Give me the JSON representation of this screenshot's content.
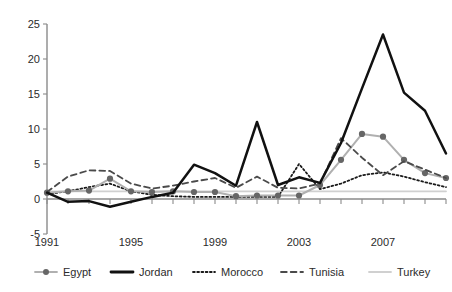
{
  "chart_data": {
    "type": "line",
    "title": "",
    "xlabel": "",
    "ylabel": "",
    "xlim": [
      1991,
      2010
    ],
    "ylim": [
      -5,
      25
    ],
    "grid": false,
    "legend_position": "bottom",
    "x": [
      1991,
      1992,
      1993,
      1994,
      1995,
      1996,
      1997,
      1998,
      1999,
      2000,
      2001,
      2002,
      2003,
      2004,
      2005,
      2006,
      2007,
      2008,
      2009,
      2010
    ],
    "xticks": [
      1991,
      1995,
      1999,
      2003,
      2007
    ],
    "xtick_labels": [
      "1991",
      "1995",
      "1999",
      "2003",
      "2007"
    ],
    "yticks": [
      -5,
      0,
      5,
      10,
      15,
      20,
      25
    ],
    "ytick_labels": [
      "-5",
      "0",
      "5",
      "10",
      "15",
      "20",
      "25"
    ],
    "series": [
      {
        "name": "Egypt",
        "color": "#b0b0b0",
        "marker": "circle",
        "marker_color": "#666666",
        "style": "solid",
        "values": [
          0.9,
          1.1,
          1.2,
          2.9,
          1.1,
          1.0,
          1.1,
          1.0,
          1.0,
          0.4,
          0.5,
          0.5,
          0.5,
          2.0,
          5.6,
          9.3,
          8.9,
          5.6,
          3.7,
          3.0
        ]
      },
      {
        "name": "Jordan",
        "color": "#111111",
        "marker": "none",
        "style": "solid",
        "values": [
          0.9,
          -0.4,
          -0.3,
          -1.1,
          -0.4,
          0.3,
          0.9,
          4.9,
          3.7,
          1.9,
          11.0,
          2.0,
          3.1,
          2.3,
          8.0,
          15.8,
          23.5,
          15.2,
          12.6,
          6.5
        ]
      },
      {
        "name": "Morocco",
        "color": "#1a1a1a",
        "marker": "none",
        "style": "dotted",
        "values": [
          0.7,
          1.1,
          1.7,
          2.2,
          1.1,
          0.6,
          0.4,
          0.3,
          0.3,
          0.3,
          0.3,
          0.3,
          5.0,
          1.4,
          2.2,
          3.4,
          3.8,
          3.2,
          2.4,
          1.7
        ]
      },
      {
        "name": "Tunisia",
        "color": "#4a4a4a",
        "marker": "none",
        "style": "dashed",
        "values": [
          1.0,
          3.2,
          4.1,
          4.0,
          2.2,
          1.5,
          1.9,
          2.5,
          3.0,
          1.6,
          3.2,
          1.6,
          1.5,
          2.2,
          8.7,
          5.9,
          3.4,
          5.4,
          4.2,
          3.0
        ]
      },
      {
        "name": "Turkey",
        "color": "#d0d0d0",
        "marker": "none",
        "style": "solid",
        "values": [
          1.1,
          1.1,
          1.1,
          1.1,
          1.1,
          1.1,
          1.1,
          1.1,
          1.1,
          1.1,
          1.1,
          1.1,
          1.1,
          1.1,
          1.1,
          1.1,
          1.1,
          1.1,
          1.1,
          1.1
        ]
      }
    ]
  },
  "legend": {
    "items": [
      {
        "label": "Egypt"
      },
      {
        "label": "Jordan"
      },
      {
        "label": "Morocco"
      },
      {
        "label": "Tunisia"
      },
      {
        "label": "Turkey"
      }
    ]
  }
}
